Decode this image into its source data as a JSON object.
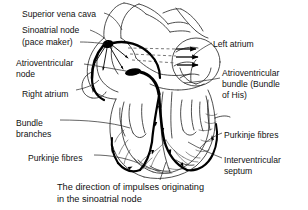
{
  "figure": {
    "type": "anatomical-diagram",
    "style": "black-and-white line drawing",
    "colors": {
      "background": "#ffffff",
      "ink": "#111111",
      "conduction_pathway": "#000000",
      "thin_line": "#333333",
      "dashed_line": "#555555"
    }
  },
  "labels": [
    {
      "id": "superior-vena-cava",
      "text": "Superior vena cava",
      "x": 22,
      "y": 9,
      "align": "left"
    },
    {
      "id": "sinoatrial-node",
      "text": "Sinoatrial node",
      "x": 22,
      "y": 25,
      "align": "left"
    },
    {
      "id": "pace-maker",
      "text": "(pace maker)",
      "x": 22,
      "y": 37,
      "align": "left"
    },
    {
      "id": "atrioventricular-node-l1",
      "text": "Atrioventricular",
      "x": 16,
      "y": 58,
      "align": "left"
    },
    {
      "id": "atrioventricular-node-l2",
      "text": "node",
      "x": 16,
      "y": 69,
      "align": "left"
    },
    {
      "id": "right-atrium",
      "text": "Right atrium",
      "x": 22,
      "y": 89,
      "align": "left"
    },
    {
      "id": "bundle-branches-l1",
      "text": "Bundle",
      "x": 16,
      "y": 118,
      "align": "left"
    },
    {
      "id": "bundle-branches-l2",
      "text": "branches",
      "x": 16,
      "y": 129,
      "align": "left"
    },
    {
      "id": "purkinje-fibres-left",
      "text": "Purkinje fibres",
      "x": 28,
      "y": 153,
      "align": "left"
    },
    {
      "id": "left-atrium",
      "text": "Left atrium",
      "x": 213,
      "y": 39,
      "align": "left"
    },
    {
      "id": "av-bundle-l1",
      "text": "Atrioventricular",
      "x": 222,
      "y": 68,
      "align": "left"
    },
    {
      "id": "av-bundle-l2",
      "text": "bundle (Bundle",
      "x": 222,
      "y": 79,
      "align": "left"
    },
    {
      "id": "av-bundle-l3",
      "text": "of His)",
      "x": 222,
      "y": 90,
      "align": "left"
    },
    {
      "id": "purkinje-fibres-right",
      "text": "Purkinje fibres",
      "x": 224,
      "y": 130,
      "align": "left"
    },
    {
      "id": "interventricular-l1",
      "text": "Interventricular",
      "x": 224,
      "y": 155,
      "align": "left"
    },
    {
      "id": "interventricular-l2",
      "text": "septum",
      "x": 224,
      "y": 166,
      "align": "left"
    }
  ],
  "caption": {
    "line1": "The direction of impulses originating",
    "line2": "in the sinoatrial node",
    "x": 57,
    "y": 182
  }
}
